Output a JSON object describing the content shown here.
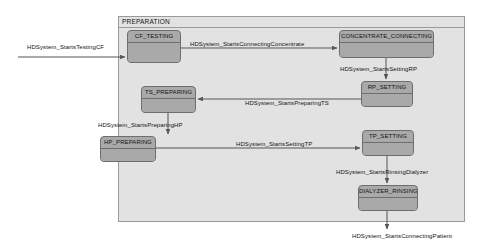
{
  "diagram": {
    "type": "state-machine",
    "title": "PREPARATION",
    "container": {
      "label": "PREPARATION",
      "x": 118,
      "y": 16,
      "w": 347,
      "h": 206,
      "fill": "#e2e2e2",
      "border": "#9a9a9a"
    },
    "colors": {
      "state_fill": "#a9a9a9",
      "state_border": "#6e6e6e",
      "container_fill": "#e2e2e2",
      "container_border": "#9a9a9a",
      "edge": "#55555a",
      "text": "#111111",
      "page_background": "#ffffff"
    },
    "states": [
      {
        "id": "cf-testing",
        "label": "CF_TESTING",
        "x": 127,
        "y": 30,
        "w": 54,
        "h": 33
      },
      {
        "id": "concentrate-connecting",
        "label": "CONCENTRATE_CONNECTING",
        "x": 339,
        "y": 30,
        "w": 95,
        "h": 28
      },
      {
        "id": "ts-preparing",
        "label": "TS_PREPARING",
        "x": 141,
        "y": 86,
        "w": 55,
        "h": 27
      },
      {
        "id": "rp-setting",
        "label": "RP_SETTING",
        "x": 361,
        "y": 81,
        "w": 52,
        "h": 26
      },
      {
        "id": "hp-preparing",
        "label": "HP_PREPARING",
        "x": 100,
        "y": 136,
        "w": 56,
        "h": 26
      },
      {
        "id": "tp-setting",
        "label": "TP_SETTING",
        "x": 362,
        "y": 130,
        "w": 52,
        "h": 26
      },
      {
        "id": "dialyzer-rinsing",
        "label": "DIALYZER_RINSING",
        "x": 358,
        "y": 185,
        "w": 60,
        "h": 26
      }
    ],
    "transitions": [
      {
        "id": "starts-testing-cf",
        "label": "HDSystem_StartsTestingCF",
        "from": "external-left",
        "to": "cf-testing",
        "label_x": 27,
        "label_y": 44
      },
      {
        "id": "starts-connecting-concentrate",
        "label": "HDSystem_StartsConnectingConcentrate",
        "from": "cf-testing",
        "to": "concentrate-connecting",
        "label_x": 190,
        "label_y": 41
      },
      {
        "id": "starts-setting-rp",
        "label": "HDSystem_StartsSettingRP",
        "from": "concentrate-connecting",
        "to": "rp-setting",
        "label_x": 340,
        "label_y": 66
      },
      {
        "id": "starts-preparing-ts",
        "label": "HDSystem_StartsPreparingTS",
        "from": "rp-setting",
        "to": "ts-preparing",
        "label_x": 245,
        "label_y": 100
      },
      {
        "id": "starts-preparing-hp",
        "label": "HDSystem_StartsPreparingHP",
        "from": "ts-preparing",
        "to": "hp-preparing",
        "label_x": 98,
        "label_y": 122
      },
      {
        "id": "starts-setting-tp",
        "label": "HDSystem_StartsSettingTP",
        "from": "hp-preparing",
        "to": "tp-setting",
        "label_x": 236,
        "label_y": 141
      },
      {
        "id": "starts-rinsing-dialyzer",
        "label": "HDSystem_StartsRinsingDialyzer",
        "from": "tp-setting",
        "to": "dialyzer-rinsing",
        "label_x": 336,
        "label_y": 169
      },
      {
        "id": "starts-connecting-patient",
        "label": "HDSystem_StartsConnectingPatient",
        "from": "dialyzer-rinsing",
        "to": "external-bottom",
        "label_x": 352,
        "label_y": 233
      }
    ]
  }
}
